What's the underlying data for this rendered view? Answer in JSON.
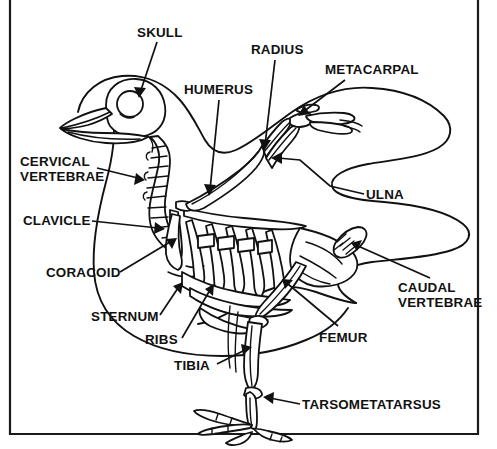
{
  "diagram": {
    "style": "black-and-white line drawing with leader-line callout labels",
    "frame": {
      "present": true,
      "color": "#1a1a1a",
      "description": "thin rectangular border surrounding the illustration"
    },
    "background_color": "#ffffff",
    "line_color": "#111111"
  },
  "labels": {
    "skull": "SKULL",
    "humerus": "HUMERUS",
    "radius": "RADIUS",
    "metacarpal": "METACARPAL",
    "ulna": "ULNA",
    "cervical_vertebrae_line1": "CERVICAL",
    "cervical_vertebrae_line2": "VERTEBRAE",
    "clavicle": "CLAVICLE",
    "coracoid": "CORACOID",
    "sternum": "STERNUM",
    "ribs": "RIBS",
    "tibia": "TIBIA",
    "femur": "FEMUR",
    "caudal_vertebrae_line1": "CAUDAL",
    "caudal_vertebrae_line2": "VERTEBRAE",
    "tarsometatarsus": "TARSOMETATARSUS"
  },
  "callouts": [
    {
      "id": "skull",
      "label": "SKULL",
      "text_x": 137,
      "text_y": 37,
      "anchor": "start",
      "points_to": "cranium"
    },
    {
      "id": "humerus",
      "label": "HUMERUS",
      "text_x": 184,
      "text_y": 94,
      "anchor": "start",
      "points_to": "upper wing bone"
    },
    {
      "id": "radius",
      "label": "RADIUS",
      "text_x": 251,
      "text_y": 54,
      "anchor": "start",
      "points_to": "forearm leading bone"
    },
    {
      "id": "metacarpal",
      "label": "METACARPAL",
      "text_x": 325,
      "text_y": 74,
      "anchor": "start",
      "points_to": "wing hand bones"
    },
    {
      "id": "ulna",
      "label": "ULNA",
      "text_x": 366,
      "text_y": 199,
      "anchor": "start",
      "points_to": "forearm trailing bone"
    },
    {
      "id": "cervical-vertebrae",
      "label": "CERVICAL VERTEBRAE",
      "text_x": 20,
      "text_y": 166,
      "anchor": "start",
      "points_to": "neck vertebrae chain"
    },
    {
      "id": "clavicle",
      "label": "CLAVICLE",
      "text_x": 23,
      "text_y": 225,
      "anchor": "start",
      "points_to": "wishbone / furcula"
    },
    {
      "id": "coracoid",
      "label": "CORACOID",
      "text_x": 46,
      "text_y": 277,
      "anchor": "start",
      "points_to": "shoulder strut bone"
    },
    {
      "id": "sternum",
      "label": "STERNUM",
      "text_x": 91,
      "text_y": 321,
      "anchor": "start",
      "points_to": "breastbone keel"
    },
    {
      "id": "ribs",
      "label": "RIBS",
      "text_x": 145,
      "text_y": 344,
      "anchor": "start",
      "points_to": "rib cage"
    },
    {
      "id": "tibia",
      "label": "TIBIA",
      "text_x": 174,
      "text_y": 370,
      "anchor": "start",
      "points_to": "lower leg bone"
    },
    {
      "id": "femur",
      "label": "FEMUR",
      "text_x": 319,
      "text_y": 342,
      "anchor": "start",
      "points_to": "thigh bone"
    },
    {
      "id": "caudal-vertebrae",
      "label": "CAUDAL VERTEBRAE",
      "text_x": 398,
      "text_y": 292,
      "anchor": "start",
      "points_to": "tail vertebrae / pygostyle"
    },
    {
      "id": "tarsometatarsus",
      "label": "TARSOMETATARSUS",
      "text_x": 302,
      "text_y": 409,
      "anchor": "start",
      "points_to": "foot shank bone"
    }
  ],
  "anatomy_parts": [
    "skull",
    "beak",
    "eye socket",
    "cervical vertebrae",
    "clavicle",
    "coracoid",
    "sternum",
    "ribs",
    "humerus",
    "radius",
    "ulna",
    "metacarpal",
    "femur",
    "tibia",
    "tarsometatarsus",
    "toes",
    "caudal vertebrae",
    "pelvis"
  ]
}
